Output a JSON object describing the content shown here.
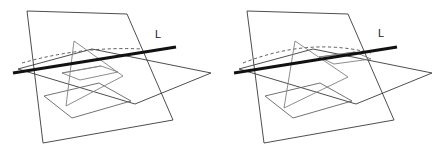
{
  "figure": {
    "background_color": "#ffffff",
    "width": 442,
    "height": 156,
    "panel_count": 2
  },
  "style": {
    "thin_stroke_color": "#3a3a3a",
    "grey_stroke_color": "#808080",
    "dashed_stroke_color": "#4a4a4a",
    "thick_stroke_color": "#111111",
    "label_color": "#1a1a1a",
    "thin_stroke_width": 0.9,
    "thick_stroke_width": 3.1,
    "dash_pattern": "3.2 2.6"
  },
  "panels": [
    {
      "id": "panel-left",
      "name": "left-diagram",
      "origin_x": 0,
      "label": {
        "text": "L",
        "x": 155,
        "y": 38
      },
      "shapes": {
        "vertical_plane": {
          "name": "vertical-plane",
          "points": "27,11 127,14 173,120 43,143"
        },
        "horizontal_plane": {
          "name": "horizontal-plane",
          "points": "18,69 92,49 211,73 135,104"
        },
        "intersection_line": {
          "name": "line-L",
          "x1": 13,
          "y1": 73,
          "x2": 176,
          "y2": 47
        },
        "dashed_arc": {
          "name": "dashed-hidden-edge",
          "path": "M 22,63 Q 82,46 142,49"
        },
        "triangle": {
          "name": "triangle",
          "points": "74,41 66,106 123,76"
        },
        "inner_parallelogram": {
          "name": "inner-parallelogram",
          "points": "62,73 101,66 118,72 80,80"
        },
        "second_quad": {
          "name": "lower-quad",
          "points": "44,96 99,83 131,101 72,118"
        },
        "grey_edge": {
          "name": "grey-edge",
          "path": "M 62,73 L 101,66"
        }
      }
    },
    {
      "id": "panel-right",
      "name": "right-diagram",
      "origin_x": 221,
      "label": {
        "text": "L",
        "x": 157,
        "y": 37
      },
      "shapes": {
        "vertical_plane": {
          "name": "vertical-plane",
          "points": "26,11 127,14 173,120 43,143"
        },
        "horizontal_plane": {
          "name": "horizontal-plane",
          "points": "18,69 92,49 211,73 135,104"
        },
        "intersection_line": {
          "name": "line-L",
          "x1": 13,
          "y1": 73,
          "x2": 176,
          "y2": 47
        },
        "dashed_arc": {
          "name": "dashed-hidden-arc",
          "path": "M 22,63 Q 88,37 150,53"
        },
        "triangle": {
          "name": "triangle",
          "points": "74,41 63,108 127,77"
        },
        "inner_parallelogram": {
          "name": "inner-parallelogram",
          "points": "98,57 134,52 150,59 113,64"
        },
        "second_quad": {
          "name": "lower-quad",
          "points": "44,96 99,83 131,101 72,118"
        },
        "grey_edge": {
          "name": "grey-edge",
          "path": "M 98,57 L 134,52"
        }
      }
    }
  ]
}
